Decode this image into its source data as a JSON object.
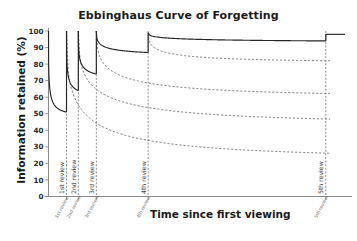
{
  "chart_data": {
    "type": "line",
    "title": "Ebbinghaus Curve of Forgetting",
    "xlabel": "Time since first viewing",
    "ylabel": "Information retained (%)",
    "ylim": [
      0,
      100
    ],
    "yticks": [
      0,
      10,
      20,
      30,
      40,
      50,
      60,
      70,
      80,
      90,
      100
    ],
    "grid": false,
    "legend_position": "none",
    "xtick_labels": [
      "1st review",
      "2nd review",
      "3rd review",
      "4th review",
      "5th review"
    ],
    "review_markers": [
      {
        "label": "1st review",
        "x_frac": 0.064,
        "retention_before": 51,
        "retention_after": 100
      },
      {
        "label": "2nd review",
        "x_frac": 0.106,
        "retention_before": 64,
        "retention_after": 100
      },
      {
        "label": "3rd review",
        "x_frac": 0.17,
        "retention_before": 74,
        "retention_after": 100
      },
      {
        "label": "4th review",
        "x_frac": 0.354,
        "retention_before": 87,
        "retention_after": 99
      },
      {
        "label": "5th review",
        "x_frac": 0.985,
        "retention_before": 94,
        "retention_after": 98
      }
    ],
    "series": [
      {
        "name": "Retention with review (solid)",
        "style": "solid",
        "description": "Memory retention boosted back toward 100% at each review, with progressively slower decay",
        "points_percent": [
          100,
          80,
          62,
          51,
          100,
          82,
          70,
          64,
          100,
          88,
          79,
          74,
          100,
          94,
          90,
          87,
          99,
          97,
          96,
          95,
          94,
          98
        ]
      },
      {
        "name": "Decay after 1st review (dashed)",
        "style": "dashed",
        "description": "Forgetting curve if no further review occurred after the 1st review",
        "start_percent": 100,
        "plateau_percent": 23
      },
      {
        "name": "Decay after 2nd review (dashed)",
        "style": "dashed",
        "description": "Forgetting curve if no further review occurred after the 2nd review",
        "start_percent": 100,
        "plateau_percent": 44
      },
      {
        "name": "Decay after 3rd review (dashed)",
        "style": "dashed",
        "description": "Forgetting curve if no further review occurred after the 3rd review",
        "start_percent": 100,
        "plateau_percent": 60
      },
      {
        "name": "Decay after 4th review (dashed)",
        "style": "dashed",
        "description": "Forgetting curve if no further review occurred after the 4th review",
        "start_percent": 99,
        "plateau_percent": 81
      }
    ],
    "colors": {
      "solid_curve": "#262626",
      "dashed_curve": "#6b6b6b",
      "axis": "#8a8a8a",
      "text": "#1a1a1a",
      "background": "#ffffff"
    }
  }
}
